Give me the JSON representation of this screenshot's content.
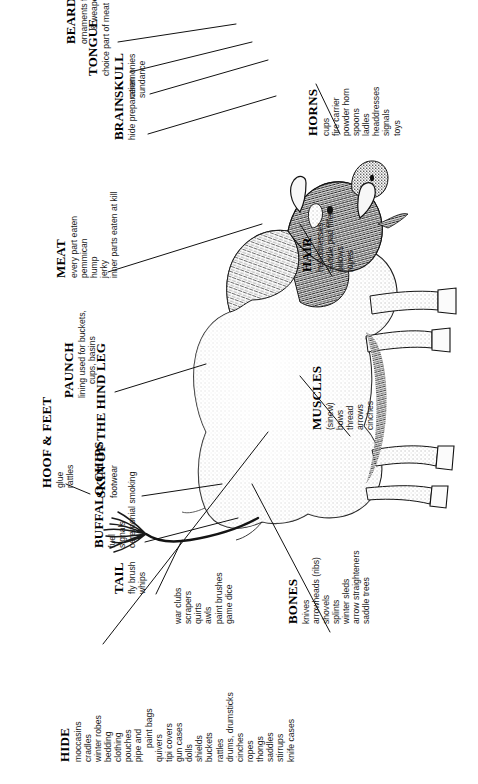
{
  "figure": {
    "subject": "buffalo",
    "orientation": "rotated-90",
    "ink_color": "#1a1a1a"
  },
  "callouts": [
    {
      "id": "hide",
      "heading": "HIDE",
      "items": [
        "moccasins",
        "cradles",
        "winter robes",
        "bedding",
        "clothing",
        "pouches",
        "pipe and",
        "paint bags",
        "quivers",
        "tipi covers",
        "gun cases",
        "dolls",
        "shields",
        "buckets",
        "rattles",
        "drums, drumsticks",
        "cinches",
        "ropes",
        "thongs",
        "saddles",
        "stirrups",
        "knife cases"
      ]
    },
    {
      "id": "bones",
      "heading": "BONES",
      "items": [
        "knives",
        "arrowheads (ribs)",
        "shovels",
        "splints",
        "winter sleds",
        "arrow straighteners",
        "saddle trees"
      ]
    },
    {
      "id": "bones2",
      "heading": "",
      "items": [
        "war clubs",
        "scrapers",
        "quirts",
        "awls",
        "paint brushes",
        "game dice"
      ]
    },
    {
      "id": "tail",
      "heading": "TAIL",
      "items": [
        "fly brush",
        "whips"
      ]
    },
    {
      "id": "buffalo-chips",
      "heading": "BUFFALO CHIPS",
      "items": [
        "fuel",
        "signals",
        "ceremonial smoking"
      ]
    },
    {
      "id": "skin-hind-leg",
      "heading": "SKIN OF THE HIND LEG",
      "items": [
        "footwear"
      ]
    },
    {
      "id": "hoof-feet",
      "heading": "HOOF & FEET",
      "items": [
        "glue",
        "rattles"
      ]
    },
    {
      "id": "muscles",
      "heading": "MUSCLES",
      "items": [
        "(sinew)",
        "bows",
        "thread",
        "arrows",
        "cinches"
      ]
    },
    {
      "id": "paunch",
      "heading": "PAUNCH",
      "items": [
        "lining used for buckets,",
        "cups, basins"
      ]
    },
    {
      "id": "hair",
      "heading": "HAIR",
      "items": [
        "headdresses",
        "saddle pad filler",
        "pillows",
        "ropes"
      ]
    },
    {
      "id": "meat",
      "heading": "MEAT",
      "items": [
        "every part eaten",
        "pemmican",
        "hump",
        "jerky",
        "inner parts eaten at kill"
      ]
    },
    {
      "id": "horns",
      "heading": "HORNS",
      "items": [
        "cups",
        "fire carrier",
        "powder horn",
        "spoons",
        "ladles",
        "headdresses",
        "signals",
        "toys"
      ]
    },
    {
      "id": "brain",
      "heading": "BRAIN",
      "items": [
        "hide preparation"
      ]
    },
    {
      "id": "skull",
      "heading": "SKULL",
      "items": [
        "ceremonies",
        "sundance"
      ]
    },
    {
      "id": "tongue",
      "heading": "TONGUE",
      "items": [
        "choice part of meat"
      ]
    },
    {
      "id": "beard",
      "heading": "BEARD",
      "items": [
        "ornaments for clothing",
        "& weapons"
      ]
    }
  ]
}
